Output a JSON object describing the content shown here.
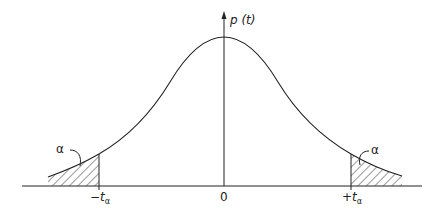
{
  "diagram": {
    "title": "",
    "type": "t-distribution probability density with two shaded tails",
    "y_axis_label": "p (t)",
    "x_tick_labels": {
      "left": "−t",
      "left_sub": "α",
      "center": "0",
      "right": "+t",
      "right_sub": "α"
    },
    "tail_labels": {
      "left": "α",
      "right": "α"
    },
    "colors": {
      "stroke": "#222222",
      "background": "#ffffff"
    }
  }
}
